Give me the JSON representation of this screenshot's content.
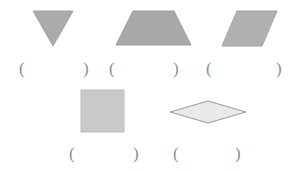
{
  "worksheet": {
    "background_color": "#ffffff",
    "paren_color": "#8d8d8d",
    "open_paren": "(",
    "close_paren": ")"
  },
  "shapes": [
    {
      "name": "triangle",
      "label": "triangle",
      "fill": "#ababab",
      "stroke": "#a2a2a2",
      "points": "25,38 5,3 45,3",
      "answer": ""
    },
    {
      "name": "trapezoid",
      "label": "trapezoid",
      "fill": "#a8a8a8",
      "stroke": "#9e9e9e",
      "points": "3,37 20,3 61,3 78,37",
      "answer": ""
    },
    {
      "name": "parallelogram",
      "label": "parallelogram",
      "fill": "#b0b0b0",
      "stroke": "#a0a0a0",
      "points": "3,38 18,3 58,3 43,38",
      "answer": ""
    },
    {
      "name": "square",
      "label": "square",
      "fill": "#c9c9c9",
      "stroke": "#bcbcbc",
      "points": "2,2 45,2 45,44 2,44",
      "answer": ""
    },
    {
      "name": "rhombus",
      "label": "rhombus",
      "fill": "#e9e9e9",
      "stroke": "#9a9a9a",
      "points": "2,13 40,2 78,13 40,24",
      "answer": ""
    }
  ],
  "answer_blanks": [
    {
      "name": "answer-blank-triangle"
    },
    {
      "name": "answer-blank-trapezoid"
    },
    {
      "name": "answer-blank-parallelogram"
    },
    {
      "name": "answer-blank-square"
    },
    {
      "name": "answer-blank-rhombus"
    }
  ]
}
